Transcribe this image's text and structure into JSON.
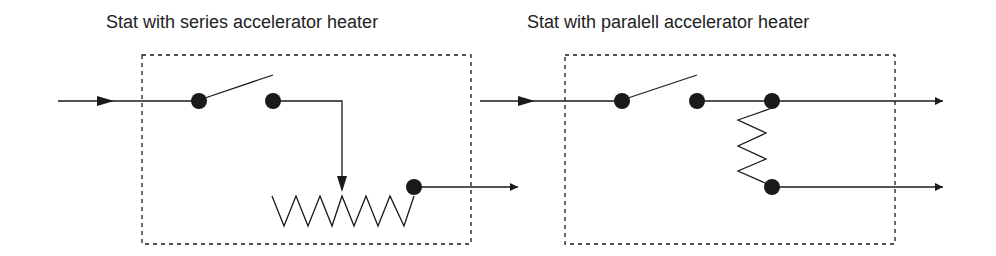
{
  "diagrams": [
    {
      "title": "Stat with series accelerator heater",
      "configuration": "series",
      "components": [
        "input-line",
        "switch",
        "variable-resistor-heater",
        "output-line"
      ]
    },
    {
      "title": "Stat with paralell accelerator heater",
      "configuration": "parallel",
      "components": [
        "input-line",
        "switch",
        "resistor-heater",
        "output-line-1",
        "output-line-2"
      ]
    }
  ],
  "colors": {
    "line": "#1a1a1a",
    "background": "#ffffff"
  }
}
